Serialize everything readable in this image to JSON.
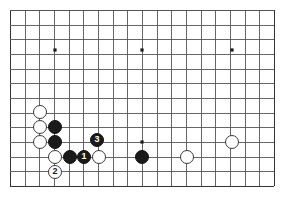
{
  "diagram": {
    "kind": "go-board-diagram",
    "board": {
      "cell": 14.67,
      "origin_x": 10,
      "origin_y": 10,
      "cols": 19,
      "rows": 13,
      "right_edge_x": 274,
      "bottom_edge_y": 186,
      "line_color": "#555555",
      "edge_color": "#333333",
      "background_color": "#ffffff",
      "star_points": [
        {
          "x": 55,
          "y": 50
        },
        {
          "x": 142,
          "y": 50
        },
        {
          "x": 232,
          "y": 50
        },
        {
          "x": 142,
          "y": 142
        }
      ]
    },
    "stones": [
      {
        "id": "w-a",
        "color": "white",
        "x": 40,
        "y": 112,
        "label": ""
      },
      {
        "id": "w-b",
        "color": "white",
        "x": 40,
        "y": 127,
        "label": ""
      },
      {
        "id": "w-c",
        "color": "white",
        "x": 40,
        "y": 142,
        "label": ""
      },
      {
        "id": "b-a",
        "color": "black",
        "x": 55,
        "y": 127,
        "label": ""
      },
      {
        "id": "b-b",
        "color": "black",
        "x": 55,
        "y": 142,
        "label": ""
      },
      {
        "id": "w-d",
        "color": "white",
        "x": 55,
        "y": 157,
        "label": ""
      },
      {
        "id": "b-c",
        "color": "black",
        "x": 70,
        "y": 157,
        "label": ""
      },
      {
        "id": "move-1",
        "color": "black",
        "x": 84,
        "y": 157,
        "label": "1"
      },
      {
        "id": "w-e",
        "color": "white",
        "x": 99,
        "y": 157,
        "label": ""
      },
      {
        "id": "move-3",
        "color": "black",
        "x": 97,
        "y": 140,
        "label": "3"
      },
      {
        "id": "move-2",
        "color": "white",
        "x": 55,
        "y": 172,
        "label": "2"
      },
      {
        "id": "b-d",
        "color": "black",
        "x": 142,
        "y": 157,
        "label": ""
      },
      {
        "id": "w-f",
        "color": "white",
        "x": 187,
        "y": 157,
        "label": ""
      },
      {
        "id": "w-g",
        "color": "white",
        "x": 232,
        "y": 142,
        "label": ""
      }
    ],
    "move_sequence": [
      {
        "number": "1",
        "color": "black"
      },
      {
        "number": "2",
        "color": "white"
      },
      {
        "number": "3",
        "color": "black"
      }
    ],
    "stone_radius": 7.4,
    "colors": {
      "black_stone": "#1a1a1a",
      "white_stone": "#ffffff",
      "white_stone_border": "#3a3a3a",
      "grid": "#555555",
      "board_edge": "#333333",
      "black_label_text": "#ffffff",
      "white_label_text": "#1a1a1a"
    }
  }
}
